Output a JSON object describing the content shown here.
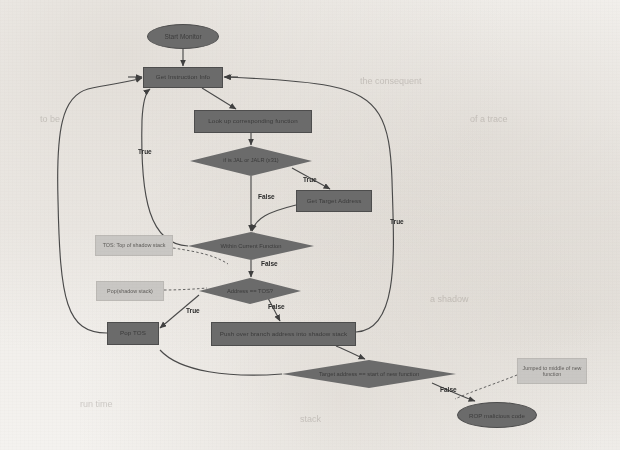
{
  "diagram": {
    "background_color": "#f3f1ee",
    "node_fill": "#6b6b6b",
    "note_fill": "#c9c7c4",
    "edge_color": "#4a4a4a",
    "nodes": [
      {
        "id": "start",
        "type": "terminator",
        "label": "Start Monitor",
        "x": 147,
        "y": 24,
        "w": 72,
        "h": 25
      },
      {
        "id": "get_info",
        "type": "process",
        "label": "Get Instruction Info",
        "x": 143,
        "y": 67,
        "w": 80,
        "h": 21
      },
      {
        "id": "lookup",
        "type": "process",
        "label": "Look up corresponding function",
        "x": 194,
        "y": 110,
        "w": 118,
        "h": 23
      },
      {
        "id": "is_jump",
        "type": "decision",
        "label": "if is JAL or JALR (x31)",
        "x": 190,
        "y": 146,
        "w": 122,
        "h": 30
      },
      {
        "id": "get_target",
        "type": "process",
        "label": "Get Target Address",
        "x": 296,
        "y": 190,
        "w": 76,
        "h": 22
      },
      {
        "id": "within_func",
        "type": "decision",
        "label": "Within Current Function",
        "x": 188,
        "y": 232,
        "w": 126,
        "h": 28
      },
      {
        "id": "addr_tos",
        "type": "decision",
        "label": "Address == TOS?",
        "x": 199,
        "y": 278,
        "w": 102,
        "h": 26
      },
      {
        "id": "pop_tos",
        "type": "process",
        "label": "Pop TOS",
        "x": 107,
        "y": 322,
        "w": 52,
        "h": 23
      },
      {
        "id": "push_addr",
        "type": "process",
        "label": "Push over branch address into shadow stack",
        "x": 211,
        "y": 322,
        "w": 145,
        "h": 24
      },
      {
        "id": "target_start",
        "type": "decision",
        "label": "Target address == start of new function",
        "x": 282,
        "y": 360,
        "w": 174,
        "h": 28
      },
      {
        "id": "rop",
        "type": "terminator",
        "label": "ROP malicious code",
        "x": 457,
        "y": 402,
        "w": 80,
        "h": 26
      }
    ],
    "notes": [
      {
        "id": "note_tos",
        "label": "TOS: Top of shadow stack",
        "x": 95,
        "y": 235,
        "w": 78,
        "h": 21
      },
      {
        "id": "note_pop",
        "label": "Pop(shadow stack)",
        "x": 96,
        "y": 281,
        "w": 68,
        "h": 20
      },
      {
        "id": "note_middle",
        "label": "Jumped to middle of new function",
        "x": 517,
        "y": 358,
        "w": 70,
        "h": 26
      }
    ],
    "edge_labels": [
      {
        "id": "true_left",
        "text": "True",
        "x": 138,
        "y": 148
      },
      {
        "id": "false_isjump",
        "text": "False",
        "x": 258,
        "y": 193
      },
      {
        "id": "true_target",
        "text": "True",
        "x": 303,
        "y": 178
      },
      {
        "id": "false_within",
        "text": "False",
        "x": 261,
        "y": 260
      },
      {
        "id": "true_right",
        "text": "True",
        "x": 390,
        "y": 218
      },
      {
        "id": "true_tos",
        "text": "True",
        "x": 186,
        "y": 309
      },
      {
        "id": "false_tos",
        "text": "False",
        "x": 268,
        "y": 305
      },
      {
        "id": "false_target",
        "text": "False",
        "x": 440,
        "y": 388
      }
    ],
    "ghost_text": [
      {
        "text": "the consequent",
        "x": 360,
        "y": 82,
        "size": 9
      },
      {
        "text": "of a trace",
        "x": 470,
        "y": 120,
        "size": 9
      },
      {
        "text": "to be",
        "x": 40,
        "y": 120,
        "size": 9
      },
      {
        "text": "a shadow",
        "x": 430,
        "y": 300,
        "size": 9
      },
      {
        "text": "run time",
        "x": 80,
        "y": 405,
        "size": 9
      },
      {
        "text": "stack",
        "x": 300,
        "y": 420,
        "size": 9
      }
    ]
  }
}
